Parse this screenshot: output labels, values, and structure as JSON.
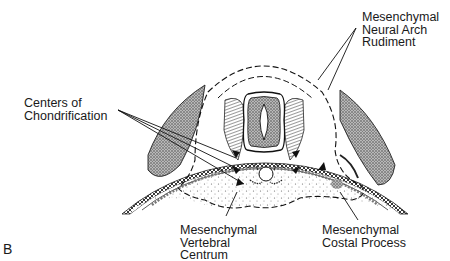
{
  "figure": {
    "panel_letter": "B"
  },
  "labels": {
    "neural_arch": [
      "Mesenchymal",
      "Neural Arch",
      "Rudiment"
    ],
    "chondrification": [
      "Centers of",
      "Chondrification"
    ],
    "centrum": [
      "Mesenchymal",
      "Vertebral",
      "Centrum"
    ],
    "costal": [
      "Mesenchymal",
      "Costal Process"
    ]
  },
  "colors": {
    "ink": "#1a1a1a",
    "stipple": "#555555",
    "background": "#ffffff"
  }
}
